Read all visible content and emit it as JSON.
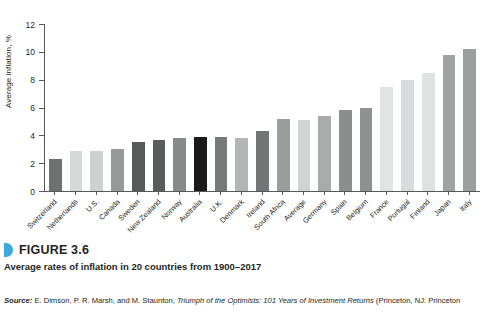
{
  "chart_data": {
    "type": "bar",
    "title": "Average rates of inflation in 20 countries from 1900–2017",
    "xlabel": "",
    "ylabel": "Average inflation, %",
    "ylim": [
      0,
      12
    ],
    "yticks": [
      0,
      2,
      4,
      6,
      8,
      10,
      12
    ],
    "grid": false,
    "legend": null,
    "categories": [
      "Switzerland",
      "Netherlands",
      "U.S.",
      "Canada",
      "Sweden",
      "New Zealand",
      "Norway",
      "Australia",
      "U.K.",
      "Denmark",
      "Ireland",
      "South Africa",
      "Average",
      "Germany",
      "Spain",
      "Belgium",
      "France",
      "Portugal",
      "Finland",
      "Japan",
      "Italy"
    ],
    "values": [
      2.3,
      2.9,
      2.9,
      3.0,
      3.5,
      3.7,
      3.8,
      3.9,
      3.9,
      3.8,
      4.3,
      5.2,
      5.1,
      5.4,
      5.8,
      6.0,
      7.5,
      8.0,
      8.5,
      9.8,
      10.2
    ],
    "bar_colors": [
      "#6f7072",
      "#d7d8d9",
      "#cfd0d1",
      "#97999b",
      "#58595b",
      "#5b5c5e",
      "#88898b",
      "#1a1a1a",
      "#77797b",
      "#b3b5b6",
      "#737476",
      "#9a9c9e",
      "#d2d3d4",
      "#a9abad",
      "#8b8d8f",
      "#8e9092",
      "#e2e3e4",
      "#d9dadb",
      "#e0e1e2",
      "#a0a2a4",
      "#9b9d9f"
    ],
    "highlighted_category": "Australia",
    "axis_color": "#58585a"
  },
  "caption": {
    "figure_number": "FIGURE 3.6",
    "figure_text": "Average rates of inflation in 20 countries from 1900–2017",
    "marker_color": "#3ba9dd"
  },
  "source": {
    "label": "Source:",
    "authors": " E. Dimson, P. R. Marsh, and M. Staunton, ",
    "work_title": "Triumph of the Optimists: 101 Years of Investment Returns",
    "publisher": " (Princeton, NJ: Princeton"
  }
}
